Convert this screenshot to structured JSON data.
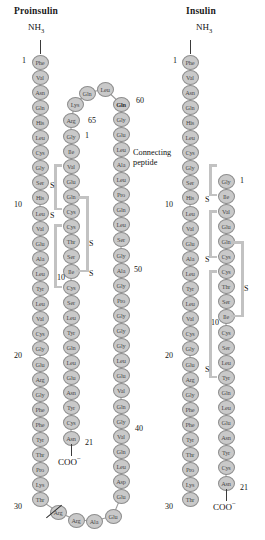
{
  "panels": [
    {
      "id": "proinsulin",
      "title": "Proinsulin",
      "n_terminus": "NH",
      "n_terminus_sub": "3",
      "c_terminus": "COO",
      "c_terminus_sup": "−",
      "connecting_peptide_label_line1": "Connecting",
      "connecting_peptide_label_line2": "peptide",
      "sulfur_label": "S",
      "numbers": [
        "1",
        "10",
        "20",
        "30",
        "1",
        "10",
        "21",
        "40",
        "50",
        "60",
        "65"
      ],
      "b_chain": [
        "Phe",
        "Val",
        "Asn",
        "Gln",
        "His",
        "Leu",
        "Cys",
        "Gly",
        "Ser",
        "His",
        "Leu",
        "Val",
        "Glu",
        "Ala",
        "Leu",
        "Tyr",
        "Leu",
        "Val",
        "Cys",
        "Gly",
        "Glu",
        "Arg",
        "Gly",
        "Phe",
        "Phe",
        "Tyr",
        "Thr",
        "Pro",
        "Lys",
        "Thr"
      ],
      "dibasic_linker": [
        "Arg",
        "Arg"
      ],
      "connecting_peptide": [
        "Glu",
        "Ala",
        "Glu",
        "Asp",
        "Leu",
        "Gln",
        "Val",
        "Gly",
        "Gln",
        "Val",
        "Glu",
        "Leu",
        "Gly",
        "Gly",
        "Gly",
        "Pro",
        "Gly",
        "Ala",
        "Gly",
        "Ser",
        "Leu",
        "Gln",
        "Pro",
        "Leu",
        "Ala",
        "Leu",
        "Glu",
        "Gly",
        "Ser",
        "Leu",
        "Gln",
        "Lys",
        "Arg"
      ],
      "c_peptide_display_down": [
        "Leu",
        "Glu",
        "Gly",
        "Ser",
        "Leu",
        "Gln",
        "Pro",
        "Leu",
        "Ala",
        "Leu",
        "Glu",
        "Gly",
        "Ser",
        "Leu",
        "Gln",
        "Gly",
        "Ala",
        "Gly",
        "Pro",
        "Gly",
        "Gly",
        "Gly",
        "Leu",
        "Glu",
        "Val",
        "Gln",
        "Gly",
        "Val",
        "Gln",
        "Leu",
        "Asp",
        "Glu",
        "Ala"
      ],
      "a_chain": [
        "Gly",
        "Ile",
        "Val",
        "Glu",
        "Gln",
        "Cys",
        "Cys",
        "Thr",
        "Ser",
        "Ile",
        "Cys",
        "Ser",
        "Leu",
        "Tyr",
        "Gln",
        "Leu",
        "Glu",
        "Asn",
        "Tyr",
        "Cys",
        "Asn"
      ],
      "crown": [
        "Arg",
        "Lys",
        "Gln",
        "Leu",
        "Gln",
        "Gly",
        "Glu"
      ]
    },
    {
      "id": "insulin",
      "title": "Insulin",
      "n_terminus": "NH",
      "n_terminus_sub": "3",
      "c_terminus": "COO",
      "c_terminus_sup": "−",
      "sulfur_label": "S",
      "numbers": [
        "1",
        "10",
        "20",
        "30",
        "1",
        "10",
        "21"
      ],
      "b_chain": [
        "Phe",
        "Val",
        "Asn",
        "Gln",
        "His",
        "Leu",
        "Cys",
        "Gly",
        "Ser",
        "His",
        "Leu",
        "Val",
        "Glu",
        "Ala",
        "Leu",
        "Tyr",
        "Leu",
        "Val",
        "Cys",
        "Gly",
        "Glu",
        "Arg",
        "Gly",
        "Phe",
        "Phe",
        "Tyr",
        "Thr",
        "Pro",
        "Lys",
        "Thr"
      ],
      "a_chain": [
        "Gly",
        "Ile",
        "Val",
        "Glu",
        "Gln",
        "Cys",
        "Cys",
        "Thr",
        "Ser",
        "Ile",
        "Cys",
        "Ser",
        "Leu",
        "Tyr",
        "Gln",
        "Leu",
        "Glu",
        "Asn",
        "Tyr",
        "Cys",
        "Asn"
      ]
    }
  ],
  "colors": {
    "residue_fill": "#c9c9c9",
    "residue_stroke": "#8d8d8d",
    "bond_gray": "#c2c2c2",
    "text": "#111111"
  }
}
